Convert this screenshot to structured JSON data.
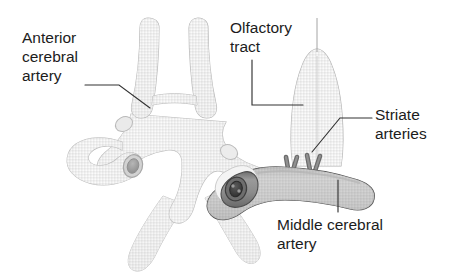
{
  "figure": {
    "background_color": "#ffffff",
    "width": 459,
    "height": 280
  },
  "labels": {
    "anterior_cerebral_artery": "Anterior\ncerebral\nartery",
    "olfactory_tract": "Olfactory\ntract",
    "striate_arteries": "Striate\narteries",
    "middle_cerebral_artery": "Middle cerebral\nartery"
  },
  "colors": {
    "text": "#1c1c1c",
    "leader_line": "#333333",
    "vessel_light_fill": "#dcdcdc",
    "vessel_light_stroke": "#b4b4b4",
    "vessel_mid_fill": "#c8c8c8",
    "vessel_dark_fill": "#8a8a8a",
    "vessel_dark_stroke": "#4a4a4a",
    "lumen_dark": "#3a3a3a",
    "olfactory_fill": "#e4e4e4",
    "olfactory_stroke": "#b0b0b0",
    "background": "#ffffff"
  },
  "structures": [
    {
      "name": "anterior-cerebral-arteries",
      "tone": "light",
      "description": "Paired vertical ascending vessels joined by a short horizontal anterior communicating artery"
    },
    {
      "name": "anterior-communicating-artery",
      "tone": "light",
      "description": "Short horizontal bridge between the two anterior cerebral arteries"
    },
    {
      "name": "circle-of-willis-polygon",
      "tone": "light",
      "description": "Central star-shaped arterial ring with limbs extending to each corner"
    },
    {
      "name": "internal-carotid-artery-left",
      "tone": "light",
      "description": "Hooked vessel on the left with a cut circular lumen end"
    },
    {
      "name": "internal-carotid-artery-right",
      "tone": "dark",
      "description": "Hooked vessel on the right with a dark cut circular lumen end"
    },
    {
      "name": "middle-cerebral-artery",
      "tone": "dark",
      "description": "Thick dark horizontal vessel at lower right curving upward to the right"
    },
    {
      "name": "striate-arteries",
      "tone": "dark",
      "description": "Two small V-shaped branch pairs rising from the top of the middle cerebral artery"
    },
    {
      "name": "olfactory-tract",
      "tone": "pale",
      "description": "Tall pale bell-shaped dome above the middle cerebral artery with faint midline"
    },
    {
      "name": "posterior-limbs",
      "tone": "light",
      "description": "Two pale lower limbs descending from the arterial polygon"
    }
  ],
  "leaders": [
    {
      "name": "leader-anterior-cerebral-artery",
      "from": "label",
      "to": "anterior-cerebral-artery"
    },
    {
      "name": "leader-olfactory-tract",
      "from": "label",
      "to": "olfactory-tract"
    },
    {
      "name": "leader-striate-arteries",
      "from": "label",
      "to": "striate-arteries"
    },
    {
      "name": "leader-middle-cerebral-artery",
      "from": "label",
      "to": "middle-cerebral-artery"
    }
  ]
}
